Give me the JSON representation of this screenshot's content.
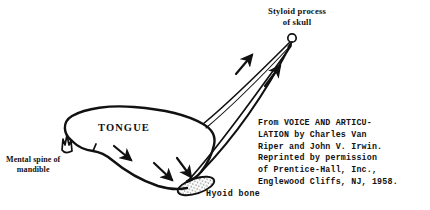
{
  "figure": {
    "background_color": "#ffffff",
    "ink_color": "#111111",
    "width": 430,
    "height": 210
  },
  "labels": {
    "tongue": "TONGUE",
    "styloid_line1": "Styloid process",
    "styloid_line2": "of skull",
    "mental_line1": "Mental spine of",
    "mental_line2": "mandible",
    "hyoid": "Hyoid bone"
  },
  "attribution": {
    "lines": [
      "From VOICE AND ARTICU-",
      "LATION by Charles Van",
      "Riper and John V. Irwin.",
      "Reprinted by permission",
      "of Prentice-Hall, Inc.,",
      "Englewood Cliffs, NJ, 1958."
    ]
  },
  "icons": {
    "arrow_tongue_tip": "arrow-icon",
    "arrow_tongue_mid": "arrow-icon",
    "arrow_hyoid": "arrow-icon",
    "arrow_muscle_lower": "arrow-icon",
    "arrow_muscle_upper": "arrow-icon"
  }
}
